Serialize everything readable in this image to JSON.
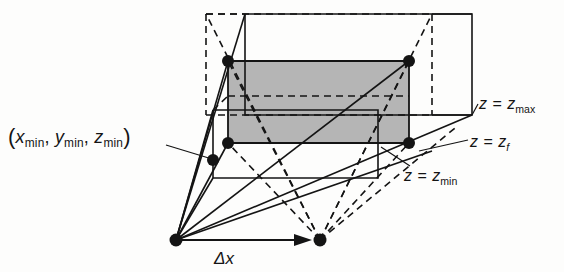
{
  "figure": {
    "type": "technical-line-diagram",
    "background_color": "#fdfdfc",
    "ink_color": "#141414",
    "shaded_fill_color": "#b5b5b5"
  },
  "labels": {
    "corner_point": {
      "open_paren": "(",
      "x_var": "x",
      "x_sub": "min",
      "comma1": ",",
      "y_var": "y",
      "y_sub": "min",
      "comma2": ",",
      "z_var": "z",
      "z_sub": "min",
      "close_paren": ")",
      "plain_text": "(x min, y min, z min)"
    },
    "z_max": {
      "lhs": "z",
      "eq": "=",
      "rhs_var": "z",
      "rhs_sub": "max",
      "plain_text": "z = z max"
    },
    "z_f": {
      "lhs": "z",
      "eq": "=",
      "rhs_var": "z",
      "rhs_sub": "f",
      "plain_text": "z = z f"
    },
    "z_min": {
      "lhs": "z",
      "eq": "=",
      "rhs_var": "z",
      "rhs_sub": "min",
      "plain_text": "z = z min"
    },
    "delta_x": {
      "delta": "Δ",
      "x_var": "x",
      "plain_text": "Δx"
    }
  },
  "geometry": {
    "eye_left": [
      176,
      240
    ],
    "eye_right": [
      320,
      240
    ],
    "outer_box": {
      "front_top_left": [
        206,
        14
      ],
      "front_top_right": [
        432,
        14
      ],
      "front_bottom_left": [
        206,
        115
      ],
      "front_bottom_right": [
        432,
        115
      ],
      "back_top_left": [
        245,
        14
      ],
      "back_top_right": [
        472,
        14
      ],
      "back_bottom_left": [
        245,
        115
      ],
      "back_bottom_right": [
        472,
        115
      ]
    },
    "shaded_rect": {
      "top_left": [
        228,
        61
      ],
      "top_right": [
        409,
        61
      ],
      "bottom_right": [
        409,
        143
      ],
      "bottom_left": [
        228,
        143
      ]
    },
    "vertex_dots": [
      [
        228,
        61
      ],
      [
        409,
        61
      ],
      [
        228,
        143
      ],
      [
        409,
        143
      ],
      [
        213,
        160
      ],
      [
        176,
        240
      ],
      [
        320,
        240
      ]
    ],
    "dot_radius": 5.5
  }
}
